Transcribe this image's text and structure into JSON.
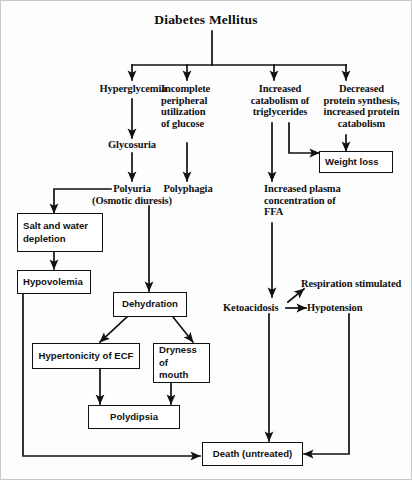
{
  "diagram": {
    "title": "Diabetes Mellitus",
    "type": "flowchart",
    "orientation": "top-down",
    "stroke_color": "#111111",
    "background_color": "#fdfdfd"
  },
  "text_nodes": {
    "hyperglycemia": "Hyperglycemia",
    "incomplete_peripheral": "Incomplete\nperipheral\nutilization\nof glucose",
    "increased_catabolism": "Increased\ncatabolism of\ntriglycerides",
    "decreased_protein": "Decreased\nprotein synthesis,\nincreased protein\ncatabolism",
    "glycosuria": "Glycosuria",
    "polyuria": "Polyuria\n(Osmotic diuresis)",
    "polyphagia": "Polyphagia",
    "increased_ffa": "Increased plasma\nconcentration of\nFFA",
    "ketoacidosis": "Ketoacidosis",
    "hypotension": "Hypotension",
    "respiration": "Respiration stimulated"
  },
  "box_nodes": {
    "weight_loss": "Weight loss",
    "salt_water": "Salt and water\ndepletion",
    "hypovolemia": "Hypovolemia",
    "dehydration": "Dehydration",
    "hypertonicity": "Hypertonicity of ECF",
    "dryness": "Dryness of\nmouth",
    "polydipsia": "Polydipsia",
    "death": "Death (untreated)"
  },
  "edges": [
    {
      "from": "diabetes-mellitus",
      "to": "hyperglycemia"
    },
    {
      "from": "diabetes-mellitus",
      "to": "incomplete-peripheral-utilization"
    },
    {
      "from": "diabetes-mellitus",
      "to": "increased-catabolism-triglycerides"
    },
    {
      "from": "diabetes-mellitus",
      "to": "decreased-protein-synthesis"
    },
    {
      "from": "hyperglycemia",
      "to": "glycosuria"
    },
    {
      "from": "glycosuria",
      "to": "polyuria"
    },
    {
      "from": "incomplete-peripheral-utilization",
      "to": "polyphagia"
    },
    {
      "from": "increased-catabolism-triglycerides",
      "to": "increased-plasma-ffa"
    },
    {
      "from": "increased-catabolism-triglycerides",
      "to": "weight-loss"
    },
    {
      "from": "decreased-protein-synthesis",
      "to": "weight-loss"
    },
    {
      "from": "polyuria",
      "to": "salt-and-water-depletion"
    },
    {
      "from": "polyuria",
      "to": "dehydration"
    },
    {
      "from": "salt-and-water-depletion",
      "to": "hypovolemia"
    },
    {
      "from": "hypovolemia",
      "to": "death"
    },
    {
      "from": "dehydration",
      "to": "hypertonicity-of-ecf"
    },
    {
      "from": "dehydration",
      "to": "dryness-of-mouth"
    },
    {
      "from": "hypertonicity-of-ecf",
      "to": "polydipsia"
    },
    {
      "from": "dryness-of-mouth",
      "to": "polydipsia"
    },
    {
      "from": "increased-plasma-ffa",
      "to": "ketoacidosis"
    },
    {
      "from": "ketoacidosis",
      "to": "hypotension"
    },
    {
      "from": "ketoacidosis",
      "to": "respiration-stimulated"
    },
    {
      "from": "ketoacidosis",
      "to": "death"
    },
    {
      "from": "hypotension",
      "to": "death"
    }
  ]
}
